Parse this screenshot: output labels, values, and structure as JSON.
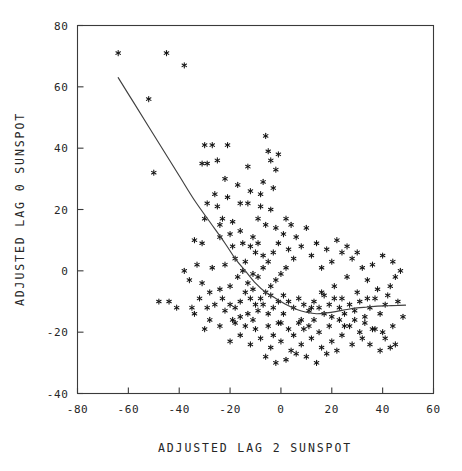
{
  "chart_data": {
    "type": "scatter",
    "title": "",
    "xlabel": "ADJUSTED LAG 2 SUNSPOT",
    "ylabel": "ADJUSTED LAG 0 SUNSPOT",
    "xlim": [
      -80,
      60
    ],
    "ylim": [
      -40,
      80
    ],
    "xticks": [
      -80,
      -60,
      -40,
      -20,
      0,
      20,
      40,
      60
    ],
    "yticks": [
      -40,
      -20,
      0,
      20,
      40,
      60,
      80
    ],
    "xticklabels": [
      "-80",
      "-60",
      "-40",
      "-20",
      "0",
      "20",
      "40",
      "60"
    ],
    "yticklabels": [
      "-40",
      "-20",
      "0",
      "20",
      "40",
      "60",
      "80"
    ],
    "grid": false,
    "legend": null,
    "marker": "asterisk",
    "marker_color": "#141414",
    "frame_color": "#3a3a3a",
    "line_color": "#404040",
    "points": [
      [
        -64,
        71
      ],
      [
        -45,
        71
      ],
      [
        -38,
        67
      ],
      [
        -52,
        56
      ],
      [
        -50,
        32
      ],
      [
        -30,
        41
      ],
      [
        -27,
        41
      ],
      [
        -21,
        41
      ],
      [
        -31,
        35
      ],
      [
        -29,
        35
      ],
      [
        -25,
        36
      ],
      [
        -22,
        30
      ],
      [
        -17,
        28
      ],
      [
        -29,
        22
      ],
      [
        -25,
        21
      ],
      [
        -30,
        17
      ],
      [
        -23,
        17
      ],
      [
        -19,
        16
      ],
      [
        -34,
        10
      ],
      [
        -31,
        9
      ],
      [
        -24,
        11
      ],
      [
        -20,
        12
      ],
      [
        -16,
        13
      ],
      [
        -13,
        22
      ],
      [
        -8,
        25
      ],
      [
        -6,
        44
      ],
      [
        -4,
        36
      ],
      [
        -2,
        33
      ],
      [
        -9,
        17
      ],
      [
        -6,
        15
      ],
      [
        -12,
        8
      ],
      [
        -10,
        6
      ],
      [
        -14,
        3
      ],
      [
        -18,
        4
      ],
      [
        -22,
        2
      ],
      [
        -27,
        1
      ],
      [
        -33,
        2
      ],
      [
        -38,
        0
      ],
      [
        -44,
        -10
      ],
      [
        -48,
        -10
      ],
      [
        -41,
        -12
      ],
      [
        -36,
        -3
      ],
      [
        -31,
        -4
      ],
      [
        -28,
        -7
      ],
      [
        -24,
        -6
      ],
      [
        -20,
        -5
      ],
      [
        -17,
        -2
      ],
      [
        -15,
        0
      ],
      [
        -13,
        -4
      ],
      [
        -11,
        -6
      ],
      [
        -9,
        -2
      ],
      [
        -7,
        1
      ],
      [
        -5,
        3
      ],
      [
        -3,
        6
      ],
      [
        -1,
        9
      ],
      [
        1,
        12
      ],
      [
        3,
        7
      ],
      [
        5,
        4
      ],
      [
        2,
        1
      ],
      [
        0,
        -1
      ],
      [
        -2,
        -3
      ],
      [
        -4,
        -5
      ],
      [
        -6,
        -7
      ],
      [
        -8,
        -9
      ],
      [
        -10,
        -11
      ],
      [
        -12,
        -9
      ],
      [
        -14,
        -7
      ],
      [
        -16,
        -10
      ],
      [
        -18,
        -12
      ],
      [
        -20,
        -11
      ],
      [
        -22,
        -13
      ],
      [
        -19,
        -16
      ],
      [
        -16,
        -15
      ],
      [
        -13,
        -14
      ],
      [
        -11,
        -16
      ],
      [
        -9,
        -13
      ],
      [
        -7,
        -11
      ],
      [
        -5,
        -14
      ],
      [
        -3,
        -12
      ],
      [
        -1,
        -10
      ],
      [
        1,
        -8
      ],
      [
        3,
        -10
      ],
      [
        5,
        -12
      ],
      [
        7,
        -9
      ],
      [
        9,
        -11
      ],
      [
        11,
        -13
      ],
      [
        13,
        -10
      ],
      [
        15,
        -12
      ],
      [
        17,
        -14
      ],
      [
        19,
        -11
      ],
      [
        21,
        -9
      ],
      [
        23,
        -12
      ],
      [
        25,
        -14
      ],
      [
        27,
        -11
      ],
      [
        29,
        -13
      ],
      [
        31,
        -10
      ],
      [
        33,
        -15
      ],
      [
        35,
        -12
      ],
      [
        37,
        -9
      ],
      [
        39,
        -14
      ],
      [
        41,
        -11
      ],
      [
        43,
        -5
      ],
      [
        45,
        -2
      ],
      [
        47,
        0
      ],
      [
        44,
        3
      ],
      [
        40,
        5
      ],
      [
        36,
        2
      ],
      [
        32,
        1
      ],
      [
        28,
        4
      ],
      [
        24,
        6
      ],
      [
        20,
        3
      ],
      [
        16,
        1
      ],
      [
        12,
        5
      ],
      [
        8,
        8
      ],
      [
        6,
        11
      ],
      [
        10,
        14
      ],
      [
        14,
        9
      ],
      [
        18,
        7
      ],
      [
        22,
        10
      ],
      [
        26,
        8
      ],
      [
        30,
        6
      ],
      [
        34,
        -3
      ],
      [
        38,
        -6
      ],
      [
        42,
        -8
      ],
      [
        46,
        -10
      ],
      [
        48,
        -15
      ],
      [
        44,
        -18
      ],
      [
        40,
        -20
      ],
      [
        36,
        -19
      ],
      [
        32,
        -22
      ],
      [
        28,
        -24
      ],
      [
        24,
        -21
      ],
      [
        20,
        -23
      ],
      [
        16,
        -25
      ],
      [
        12,
        -22
      ],
      [
        8,
        -24
      ],
      [
        4,
        -26
      ],
      [
        0,
        -23
      ],
      [
        -4,
        -25
      ],
      [
        -8,
        -22
      ],
      [
        -12,
        -24
      ],
      [
        -16,
        -21
      ],
      [
        -20,
        -23
      ],
      [
        -24,
        -18
      ],
      [
        -28,
        -16
      ],
      [
        -6,
        -28
      ],
      [
        -2,
        -30
      ],
      [
        2,
        -29
      ],
      [
        6,
        -27
      ],
      [
        10,
        -28
      ],
      [
        14,
        -30
      ],
      [
        18,
        -27
      ],
      [
        22,
        -26
      ],
      [
        -10,
        -19
      ],
      [
        -14,
        -18
      ],
      [
        -18,
        -17
      ],
      [
        -5,
        -18
      ],
      [
        -1,
        -17
      ],
      [
        3,
        -19
      ],
      [
        7,
        -17
      ],
      [
        11,
        -18
      ],
      [
        15,
        -20
      ],
      [
        19,
        -18
      ],
      [
        23,
        -16
      ],
      [
        27,
        -18
      ],
      [
        31,
        -20
      ],
      [
        35,
        -24
      ],
      [
        39,
        -26
      ],
      [
        43,
        -25
      ],
      [
        -23,
        -9
      ],
      [
        -26,
        -11
      ],
      [
        -29,
        -12
      ],
      [
        -32,
        -9
      ],
      [
        -35,
        -12
      ],
      [
        26,
        -2
      ],
      [
        30,
        -7
      ],
      [
        34,
        -9
      ],
      [
        2,
        17
      ],
      [
        -4,
        20
      ],
      [
        -8,
        21
      ],
      [
        -2,
        14
      ],
      [
        4,
        15
      ],
      [
        -11,
        11
      ],
      [
        -15,
        9
      ],
      [
        -19,
        8
      ],
      [
        -24,
        15
      ],
      [
        -26,
        25
      ],
      [
        -21,
        24
      ],
      [
        -16,
        22
      ],
      [
        -12,
        26
      ],
      [
        -7,
        29
      ],
      [
        -3,
        27
      ],
      [
        -5,
        39
      ],
      [
        -1,
        38
      ],
      [
        -13,
        34
      ],
      [
        0,
        -17
      ],
      [
        -3,
        -21
      ],
      [
        5,
        -21
      ],
      [
        9,
        -19
      ],
      [
        13,
        -16
      ],
      [
        17,
        -8
      ],
      [
        21,
        -5
      ],
      [
        25,
        -18
      ],
      [
        29,
        -16
      ],
      [
        33,
        -17
      ],
      [
        37,
        -19
      ],
      [
        41,
        -22
      ],
      [
        45,
        -24
      ],
      [
        -30,
        -19
      ],
      [
        -34,
        -14
      ],
      [
        -7,
        5
      ],
      [
        -9,
        9
      ],
      [
        -11,
        -1
      ],
      [
        1,
        -14
      ],
      [
        -4,
        -8
      ],
      [
        8,
        -16
      ],
      [
        12,
        -12
      ],
      [
        16,
        -7
      ],
      [
        20,
        -15
      ],
      [
        24,
        -9
      ]
    ],
    "fit_curve": {
      "description": "smooth fitted lowess curve",
      "points": [
        [
          -64,
          63
        ],
        [
          -58,
          55
        ],
        [
          -52,
          47
        ],
        [
          -46,
          39
        ],
        [
          -40,
          31
        ],
        [
          -34,
          23
        ],
        [
          -28,
          16
        ],
        [
          -22,
          9
        ],
        [
          -18,
          4
        ],
        [
          -14,
          0
        ],
        [
          -10,
          -4
        ],
        [
          -6,
          -7
        ],
        [
          -2,
          -9
        ],
        [
          2,
          -11
        ],
        [
          6,
          -12.5
        ],
        [
          10,
          -13.5
        ],
        [
          14,
          -14
        ],
        [
          18,
          -13.7
        ],
        [
          22,
          -13.2
        ],
        [
          26,
          -12.6
        ],
        [
          30,
          -12.1
        ],
        [
          34,
          -11.8
        ],
        [
          38,
          -11.5
        ],
        [
          42,
          -11.4
        ],
        [
          46,
          -11.3
        ],
        [
          49,
          -11.2
        ]
      ]
    }
  }
}
